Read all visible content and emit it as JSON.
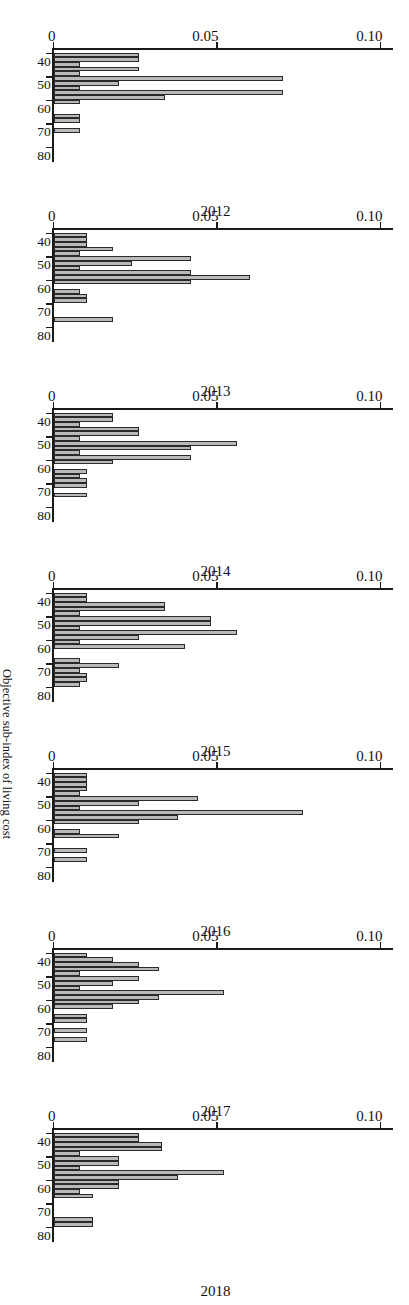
{
  "figure": {
    "density_axis_title": "Density",
    "value_axis_title": "Objective sub-index of living cost",
    "density_ticks": [
      "0",
      "0.05",
      "0.10"
    ],
    "value_ticks": [
      "40",
      "50",
      "60",
      "70",
      "80"
    ],
    "bar_fill_color": "#b9b9b9",
    "bar_line_color": "#2a2a2a",
    "axis_color": "#1a1a1a"
  },
  "chart_data": {
    "type": "bar",
    "title": "",
    "subtitle": "",
    "xlabel": "Objective sub-index of living cost",
    "ylabel": "Density",
    "xlim": [
      38,
      84
    ],
    "ylim": [
      0,
      0.115
    ],
    "grid": false,
    "legend": "none",
    "orientation": "horizontal-rotated-90ccw",
    "bin_width": 2,
    "panel_labels": [
      "2012",
      "2013",
      "2014",
      "2015",
      "2016",
      "2017",
      "2018"
    ],
    "bin_centers": [
      39,
      41,
      43,
      45,
      47,
      49,
      51,
      53,
      55,
      57,
      59,
      61,
      63,
      65,
      67,
      69,
      71,
      73,
      75,
      77,
      79,
      81
    ],
    "series": [
      {
        "name": "2012",
        "values": [
          0.0,
          0.026,
          0.026,
          0.008,
          0.026,
          0.008,
          0.07,
          0.02,
          0.008,
          0.07,
          0.034,
          0.008,
          0.0,
          0.0,
          0.008,
          0.008,
          0.0,
          0.008,
          0.0,
          0.0,
          0.0,
          0.0
        ]
      },
      {
        "name": "2013",
        "values": [
          0.0,
          0.01,
          0.01,
          0.01,
          0.018,
          0.008,
          0.042,
          0.024,
          0.008,
          0.042,
          0.06,
          0.042,
          0.0,
          0.008,
          0.01,
          0.01,
          0.0,
          0.0,
          0.0,
          0.018,
          0.0,
          0.0
        ]
      },
      {
        "name": "2014",
        "values": [
          0.0,
          0.018,
          0.018,
          0.008,
          0.026,
          0.026,
          0.008,
          0.056,
          0.042,
          0.008,
          0.042,
          0.018,
          0.0,
          0.01,
          0.008,
          0.01,
          0.01,
          0.0,
          0.01,
          0.0,
          0.0,
          0.0
        ]
      },
      {
        "name": "2015",
        "values": [
          0.0,
          0.01,
          0.01,
          0.034,
          0.034,
          0.008,
          0.048,
          0.048,
          0.008,
          0.056,
          0.026,
          0.008,
          0.04,
          0.0,
          0.0,
          0.008,
          0.02,
          0.008,
          0.01,
          0.01,
          0.008,
          0.0
        ]
      },
      {
        "name": "2016",
        "values": [
          0.0,
          0.01,
          0.01,
          0.01,
          0.01,
          0.008,
          0.044,
          0.026,
          0.008,
          0.076,
          0.038,
          0.026,
          0.0,
          0.008,
          0.02,
          0.0,
          0.0,
          0.01,
          0.0,
          0.01,
          0.0,
          0.0
        ]
      },
      {
        "name": "2017",
        "values": [
          0.0,
          0.01,
          0.018,
          0.026,
          0.032,
          0.008,
          0.026,
          0.018,
          0.008,
          0.052,
          0.032,
          0.026,
          0.018,
          0.0,
          0.01,
          0.01,
          0.0,
          0.01,
          0.0,
          0.01,
          0.0,
          0.0
        ]
      },
      {
        "name": "2018",
        "values": [
          0.0,
          0.026,
          0.026,
          0.033,
          0.033,
          0.008,
          0.02,
          0.02,
          0.008,
          0.052,
          0.038,
          0.02,
          0.02,
          0.008,
          0.012,
          0.0,
          0.0,
          0.0,
          0.0,
          0.012,
          0.012,
          0.0
        ]
      }
    ]
  }
}
